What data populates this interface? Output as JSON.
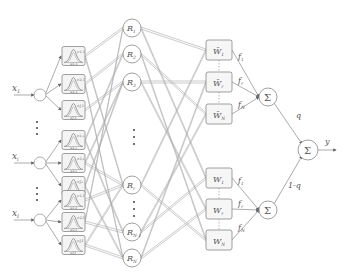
{
  "diagram": {
    "type": "type-2 fuzzy neural network",
    "inputs": [
      {
        "label": "x",
        "sub": "1",
        "y": 95
      },
      {
        "label": "x",
        "sub": "i",
        "y": 163
      },
      {
        "label": "x",
        "sub": "I",
        "y": 220
      }
    ],
    "membership_boxes": [
      {
        "y": 56,
        "top": "σ1,1",
        "bottom": "u1,1"
      },
      {
        "y": 84,
        "top": "σ2,1",
        "bottom": "u2,1"
      },
      {
        "y": 110,
        "top": "σJ,1",
        "bottom": "uJ,1"
      },
      {
        "y": 140,
        "top": "σ1,i",
        "bottom": "u1,i"
      },
      {
        "y": 163,
        "top": "σ2,i",
        "bottom": "u2,i"
      },
      {
        "y": 186,
        "top": "σJ,i",
        "bottom": "uJ,i"
      },
      {
        "y": 200,
        "top": "σ1,I",
        "bottom": "u1,I"
      },
      {
        "y": 222,
        "top": "σ2,I",
        "bottom": "u2,I"
      },
      {
        "y": 245,
        "top": "σJ,I",
        "bottom": "uJ,I"
      }
    ],
    "rules": [
      {
        "label": "R",
        "sub": "1",
        "y": 28
      },
      {
        "label": "R",
        "sub": "2",
        "y": 54
      },
      {
        "label": "R",
        "sub": "3",
        "y": 82
      },
      {
        "label": "R",
        "sub": "r",
        "y": 185
      },
      {
        "label": "R",
        "sub": "N-1",
        "y": 232
      },
      {
        "label": "R",
        "sub": "N",
        "y": 258
      }
    ],
    "weights_upper": [
      {
        "label": "W̄",
        "sub": "1",
        "f": "f",
        "fsub": "1",
        "y": 50
      },
      {
        "label": "W̄",
        "sub": "r",
        "f": "f",
        "fsub": "r",
        "y": 82
      },
      {
        "label": "W̄",
        "sub": "N",
        "f": "f",
        "fsub": "N",
        "y": 114
      }
    ],
    "weights_lower": [
      {
        "label": "W",
        "sub": "1",
        "f": "f",
        "fsub": "1",
        "y": 178
      },
      {
        "label": "W",
        "sub": "r",
        "f": "f",
        "fsub": "r",
        "y": 209
      },
      {
        "label": "W",
        "sub": "N",
        "f": "f",
        "fsub": "N",
        "y": 240
      }
    ],
    "sum_upper": {
      "label": "Σ"
    },
    "sum_lower": {
      "label": "Σ"
    },
    "sum_output": {
      "label": "Σ"
    },
    "edge_upper": "q",
    "edge_lower": "1-q",
    "output": "y",
    "colors": {
      "stroke": "#888888",
      "text": "#555555",
      "mf_curve": "#777777"
    }
  }
}
